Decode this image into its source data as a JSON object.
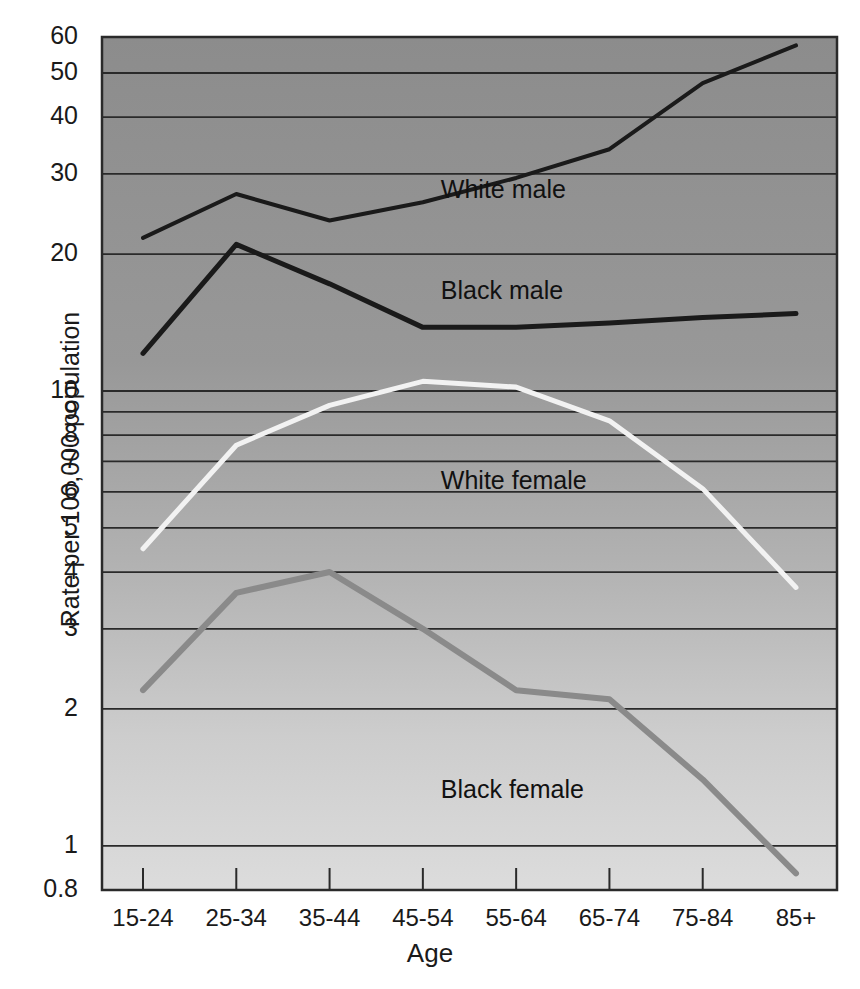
{
  "chart_data": {
    "type": "line",
    "title": "",
    "xlabel": "Age",
    "ylabel": "Rate per 100,000 population",
    "categories": [
      "15-24",
      "25-34",
      "35-44",
      "45-54",
      "55-64",
      "65-74",
      "75-84",
      "85+"
    ],
    "yscale": "log",
    "ylim": [
      0.8,
      60
    ],
    "yticks": [
      "0.8",
      "1",
      "2",
      "3",
      "4",
      "5",
      "6",
      "7",
      "8",
      "9",
      "10",
      "20",
      "30",
      "40",
      "50",
      "60"
    ],
    "ytick_values": [
      0.8,
      1,
      2,
      3,
      4,
      5,
      6,
      7,
      8,
      9,
      10,
      20,
      30,
      40,
      50,
      60
    ],
    "grid": "horizontal",
    "legend_position": "inline-annotations",
    "series": [
      {
        "name": "White male",
        "color": "#1a1a1a",
        "width": 4,
        "values": [
          21.7,
          27.1,
          23.7,
          26.0,
          29.4,
          34.0,
          47.5,
          57.5
        ],
        "label_x": "45-54",
        "label_value": 27.5
      },
      {
        "name": "Black male",
        "color": "#1a1a1a",
        "width": 5,
        "values": [
          12.1,
          21.0,
          17.2,
          13.8,
          13.8,
          14.1,
          14.5,
          14.8
        ],
        "label_x": "45-54",
        "label_value": 16.5
      },
      {
        "name": "White female",
        "color": "#f2f2f2",
        "width": 5,
        "values": [
          4.5,
          7.6,
          9.3,
          10.5,
          10.2,
          8.6,
          6.1,
          3.7
        ],
        "label_x": "45-54",
        "label_value": 6.3
      },
      {
        "name": "Black female",
        "color": "#8a8a8a",
        "width": 6,
        "values": [
          2.2,
          3.6,
          4.0,
          3.0,
          2.2,
          2.1,
          1.4,
          0.87
        ],
        "label_x": "45-54",
        "label_value": 1.32
      }
    ]
  },
  "plot": {
    "bg_top_color": "#8e8e8e",
    "bg_bottom_color": "#d8d8d8",
    "gridline_color": "#2a2a2a",
    "border_color": "#2a2a2a"
  }
}
